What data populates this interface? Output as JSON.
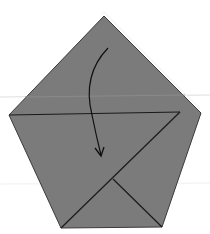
{
  "diagram": {
    "type": "origami-fold-step",
    "colors": {
      "background": "#ffffff",
      "paper_fill": "#7b7b7b",
      "fold_line": "#1a1a1a",
      "guide_line": "#dedede",
      "highlight_edge": "#f4f4f4"
    },
    "shape": {
      "name": "pentagon",
      "vertices": {
        "apex": [
          104,
          16
        ],
        "right": [
          201,
          113
        ],
        "bottom_right": [
          162,
          227
        ],
        "bottom_left": [
          61,
          228
        ],
        "left": [
          9,
          115
        ]
      }
    },
    "fold_lines": [
      {
        "name": "horizontal-crease",
        "from": [
          9,
          115
        ],
        "to": [
          180,
          112
        ]
      },
      {
        "name": "diagonal-crease",
        "from": [
          180,
          112
        ],
        "to": [
          61,
          228
        ]
      },
      {
        "name": "inner-diagonal",
        "from": [
          113,
          179
        ],
        "to": [
          162,
          227
        ]
      }
    ],
    "guide_lines": [
      {
        "name": "top-guide",
        "y": 97
      },
      {
        "name": "bottom-guide",
        "y": 184
      }
    ],
    "arrow": {
      "name": "fold-down-arrow",
      "start": [
        108,
        48
      ],
      "control": [
        78,
        100
      ],
      "end": [
        100,
        155
      ]
    }
  }
}
